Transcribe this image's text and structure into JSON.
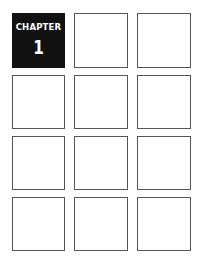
{
  "chapter": {
    "label": "CHAPTER",
    "number": "1",
    "background_color": "#111111",
    "text_color": "#ffffff"
  },
  "grid": {
    "rows": 4,
    "columns": 3,
    "border_color": "#555555",
    "empty_cells": 11
  }
}
